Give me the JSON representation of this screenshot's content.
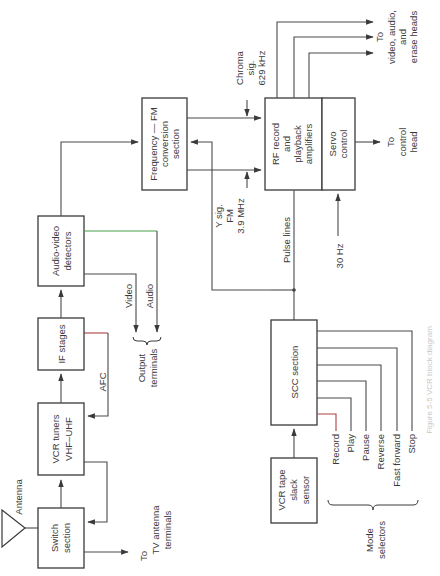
{
  "figure": {
    "orientation": "rotated 90 degrees counter-clockwise (text reads bottom-to-top)",
    "caption": "Figure 5-5 VCR block diagram"
  },
  "blocks": {
    "switch_section": [
      "Switch",
      "section"
    ],
    "vcr_tuners": [
      "VCR tuners",
      "VHF–UHF"
    ],
    "if_stages": [
      "IF stages"
    ],
    "audio_video_detectors": [
      "Audio-video",
      "detectors"
    ],
    "frequency_fm": [
      "Frequency — FM",
      "conversion",
      "section"
    ],
    "rf_record": [
      "RF record",
      "and",
      "playback",
      "amplifiers"
    ],
    "servo_control": [
      "Servo",
      "control"
    ],
    "scc_section": [
      "SCC section"
    ],
    "tape_slack_sensor": [
      "VCR tape",
      "slack",
      "sensor"
    ]
  },
  "labels": {
    "antenna": "Antenna",
    "to_tv": [
      "To",
      "TV antenna",
      "terminals"
    ],
    "afc": "AFC",
    "video": "Video",
    "audio": "Audio",
    "output_terminals": [
      "Output",
      "terminals"
    ],
    "chroma": [
      "Chroma",
      "sig.",
      "629 kHz"
    ],
    "y_sig": [
      "Y sig.",
      "FM",
      "3.9 MHz"
    ],
    "pulse_lines": "Pulse lines",
    "hz30": "30 Hz",
    "to_heads": [
      "To",
      "video, audio,",
      "and",
      "erase heads"
    ],
    "to_control": [
      "To",
      "control",
      "head"
    ],
    "mode_selectors_title": [
      "Mode",
      "selectors"
    ],
    "mode_selectors": [
      "Record",
      "Play",
      "Pause",
      "Reverse",
      "Fast forward",
      "Stop"
    ]
  }
}
